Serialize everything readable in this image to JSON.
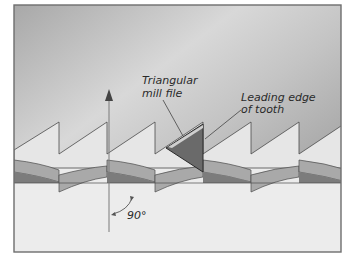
{
  "figure": {
    "type": "technical-illustration",
    "labels": {
      "file": [
        "Triangular",
        "mill file"
      ],
      "leading_edge": [
        "Leading edge",
        "of tooth"
      ],
      "angle": "90°"
    },
    "colors": {
      "frame_border": "#6e6e6e",
      "background_dark": "#9a9a9a",
      "background_light": "#d4d4d4",
      "tooth_fill": "#e6e6e6",
      "band_mid": "#a9a9a9",
      "band_dark": "#7c7c7c",
      "file_fill": "#6a6a6a",
      "base_fill": "#ececec",
      "line": "#4a4a4a"
    },
    "teeth_count": 6
  }
}
